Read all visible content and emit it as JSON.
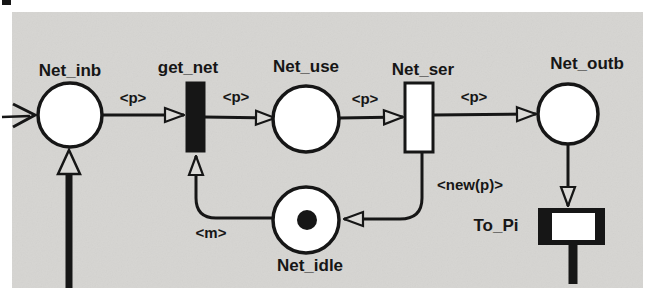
{
  "figure": {
    "places": {
      "net_inb": {
        "label": "Net_inb"
      },
      "net_use": {
        "label": "Net_use"
      },
      "net_outb": {
        "label": "Net_outb"
      },
      "net_idle": {
        "label": "Net_idle",
        "tokens": 1
      }
    },
    "transitions": {
      "get_net": {
        "label": "get_net",
        "style": "filled"
      },
      "net_ser": {
        "label": "Net_ser",
        "style": "outline"
      },
      "to_pi": {
        "label": "To_Pi",
        "style": "substitution"
      }
    },
    "arc_labels": {
      "inb_to_getnet": "<p>",
      "getnet_to_use": "<p>",
      "use_to_ser": "<p>",
      "ser_to_outb": "<p>",
      "idle_to_getnet": "<m>",
      "ser_to_idle": "<new(p)>"
    }
  },
  "colors": {
    "page_bg": "#ffffff",
    "panel_bg": "#d6d5d2",
    "ink": "#161616",
    "shape_fill": "#ffffff"
  }
}
